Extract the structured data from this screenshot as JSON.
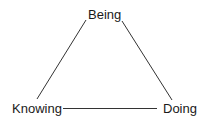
{
  "diagram": {
    "type": "triangle",
    "nodes": [
      {
        "id": "being",
        "label": "Being",
        "position": "top"
      },
      {
        "id": "knowing",
        "label": "Knowing",
        "position": "bottom-left"
      },
      {
        "id": "doing",
        "label": "Doing",
        "position": "bottom-right"
      }
    ],
    "edges": [
      {
        "from": "being",
        "to": "knowing"
      },
      {
        "from": "being",
        "to": "doing"
      },
      {
        "from": "knowing",
        "to": "doing"
      }
    ],
    "colors": {
      "line": "#333333",
      "text": "#1a1a1a",
      "background": "#ffffff"
    }
  }
}
